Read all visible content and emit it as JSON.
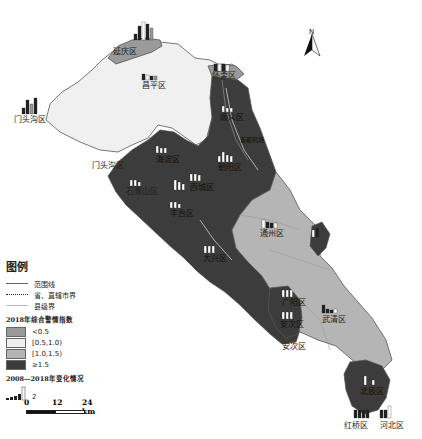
{
  "map": {
    "colors": {
      "lt_0_5": "#9a9a9a",
      "0_5_1_0": "#f0f0f0",
      "1_0_1_5": "#b5b5b5",
      "ge_1_5": "#3c3c3c",
      "border": "#555555"
    },
    "labels": {
      "yanqing": "延庆区",
      "changping": "昌平区",
      "mentougou_top": "门头沟区",
      "mentougou": "门头沟区",
      "huairou": "怀柔区",
      "shunyi": "顺义区",
      "airport": "首都机场",
      "haidian": "海淀区",
      "chaoyang": "朝阳区",
      "shijingshan": "石景山区",
      "xicheng": "西城区",
      "fengtai": "丰台区",
      "daxing": "大兴区",
      "tongzhou": "通州区",
      "guangyang": "广阳区",
      "anci": "安次区",
      "anci_lower": "安次区",
      "wuqing": "武清区",
      "beichen": "北辰区",
      "hongqiao": "红桥区",
      "hebei": "河北区"
    },
    "north_label": "N"
  },
  "legend": {
    "title": "图例",
    "lines": [
      {
        "label": "范围线"
      },
      {
        "label": "省、直辖市界"
      },
      {
        "label": "县级界"
      }
    ],
    "index_title": "2018年综合警情指数",
    "classes": [
      {
        "label": "<0.5",
        "color": "#9a9a9a"
      },
      {
        "label": "[0.5,1.0)",
        "color": "#f0f0f0"
      },
      {
        "label": "[1.0,1.5)",
        "color": "#b5b5b5"
      },
      {
        "label": "≥1.5",
        "color": "#3c3c3c"
      }
    ],
    "change_title": "2008—2018年变化情况",
    "change_value": "2"
  },
  "scale": {
    "ticks": [
      "0",
      "12",
      "24 km"
    ]
  }
}
